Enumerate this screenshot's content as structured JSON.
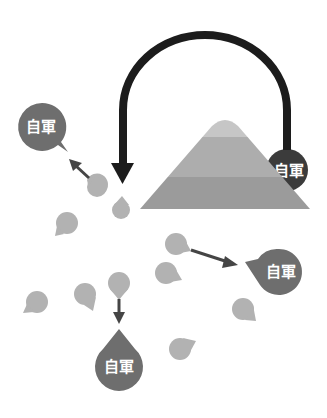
{
  "colors": {
    "background": "#ffffff",
    "arch_arrow": "#1c1c1c",
    "small_arrow": "#454545",
    "ally_pin": "#6e6e6e",
    "ally_pin_dark": "#3b3b3b",
    "neutral_pin": "#b2b2b2",
    "mountain_top": "#c6c6c6",
    "mountain_middle": "#adadad",
    "mountain_bottom": "#9b9b9b"
  },
  "labels": {
    "ally_top_left": "自軍",
    "ally_behind_mountain": "自軍",
    "ally_right": "自軍",
    "ally_bottom": "自軍"
  },
  "mountain": {
    "bands": [
      "top",
      "middle",
      "bottom"
    ]
  },
  "neutral_pins_count": 9,
  "ally_pins_count": 4,
  "arrows": [
    {
      "from": "mountain-ally-pin",
      "to": "center",
      "style": "large-arch"
    },
    {
      "from": "small-pin",
      "to": "ally-top-left"
    },
    {
      "from": "small-pin",
      "to": "ally-right"
    },
    {
      "from": "small-pin",
      "to": "ally-bottom"
    }
  ]
}
